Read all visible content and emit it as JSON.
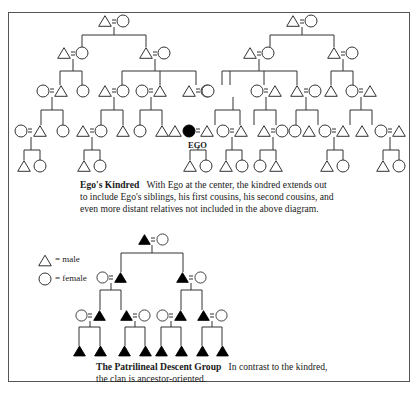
{
  "kindred": {
    "ego_label": "EGO",
    "caption_title": "Ego's Kindred",
    "caption_lines": [
      "With Ego at the center, the kindred extends out",
      "to include Ego's siblings, his first cousins, his second cousins, and",
      "even more distant relatives not included in the above diagram."
    ]
  },
  "legend": {
    "male_label": "= male",
    "female_label": "= female"
  },
  "patrilineal": {
    "caption_title": "The Patrilineal Descent Group",
    "caption_lines": [
      "In contrast to the kindred,",
      "the clan is ancestor-oriented."
    ]
  },
  "colors": {
    "line": "#333333",
    "filled": "#000000",
    "frame": "#555555"
  }
}
